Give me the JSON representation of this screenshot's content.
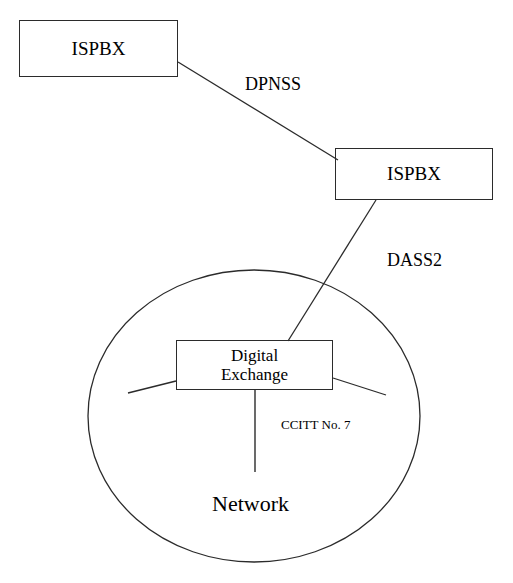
{
  "diagram": {
    "background_color": "#ffffff",
    "line_color": "#2b2b2b",
    "nodes": [
      {
        "id": "ispbx-1",
        "label": "ISPBX",
        "shape": "rectangle"
      },
      {
        "id": "ispbx-2",
        "label": "ISPBX",
        "shape": "rectangle"
      },
      {
        "id": "digital-exchange",
        "label": "Digital\nExchange",
        "shape": "rectangle"
      },
      {
        "id": "network",
        "label": "Network",
        "shape": "circle"
      }
    ],
    "edges": [
      {
        "id": "edge-dpnss",
        "label": "DPNSS",
        "from": "ispbx-1",
        "to": "ispbx-2"
      },
      {
        "id": "edge-dass2",
        "label": "DASS2",
        "from": "ispbx-2",
        "to": "digital-exchange"
      },
      {
        "id": "edge-ccitt",
        "label": "CCITT No. 7",
        "from": "digital-exchange",
        "to": "network"
      },
      {
        "id": "edge-exchange-left",
        "label": "",
        "from": "digital-exchange",
        "to": "network"
      },
      {
        "id": "edge-exchange-right",
        "label": "",
        "from": "digital-exchange",
        "to": "network"
      }
    ]
  }
}
